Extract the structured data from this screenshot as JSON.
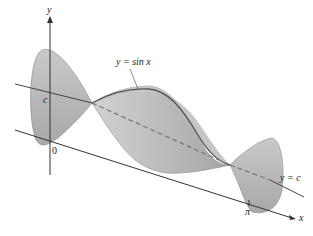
{
  "figure": {
    "labels": {
      "y_axis": "y",
      "x_axis": "x",
      "curve": "y = sin x",
      "axis_line": "y = c",
      "c_tick": "c",
      "origin": "0",
      "pi_tick": "π"
    },
    "colors": {
      "surface_fill": "#b9b9b9",
      "surface_light": "#d6d6d6",
      "surface_dark": "#9a9a9a",
      "axis": "#333333",
      "dash": "#777777"
    }
  }
}
